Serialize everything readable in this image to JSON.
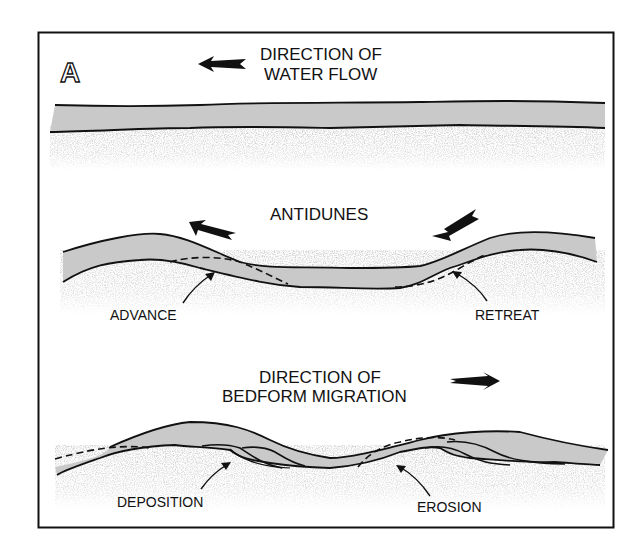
{
  "figure": {
    "panel_letter": "A",
    "colors": {
      "frame": "#111111",
      "water_layer": "#c9c9c9",
      "sediment_speckle": "#b5b5b5",
      "line": "#111111",
      "background": "#ffffff"
    }
  },
  "section_flat": {
    "title_line1": "DIRECTION OF",
    "title_line2": "WATER FLOW",
    "arrow_direction": "left"
  },
  "section_antidunes": {
    "title": "ANTIDUNES",
    "left_arrow_direction": "up-left",
    "right_arrow_direction": "down-left",
    "label_left": "ADVANCE",
    "label_right": "RETREAT"
  },
  "section_migration": {
    "title_line1": "DIRECTION OF",
    "title_line2": "BEDFORM MIGRATION",
    "arrow_direction": "right",
    "label_left": "DEPOSITION",
    "label_right": "EROSION"
  }
}
